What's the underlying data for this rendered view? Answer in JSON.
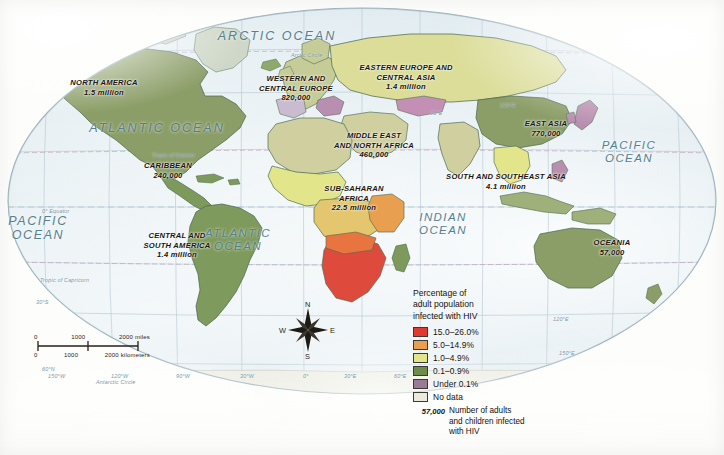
{
  "map": {
    "title": "World HIV prevalence map",
    "projection_shape": "oval",
    "ocean_labels": [
      {
        "name": "arctic-ocean",
        "text": "ARCTIC OCEAN",
        "x": 277,
        "y": 36,
        "size": 12.5,
        "spacing": 2.0
      },
      {
        "name": "atlantic-ocean-north",
        "text": "ATLANTIC OCEAN",
        "x": 157,
        "y": 128,
        "size": 12.5,
        "spacing": 2.0
      },
      {
        "name": "pacific-ocean-west",
        "text": "PACIFIC\nOCEAN",
        "x": 38,
        "y": 228,
        "size": 12.5,
        "spacing": 1.6
      },
      {
        "name": "atlantic-ocean-south",
        "text": "ATLANTIC\nOCEAN",
        "x": 238,
        "y": 240,
        "size": 11.5,
        "spacing": 1.4
      },
      {
        "name": "indian-ocean",
        "text": "INDIAN\nOCEAN",
        "x": 443,
        "y": 224,
        "size": 11.5,
        "spacing": 1.4
      },
      {
        "name": "pacific-ocean-east",
        "text": "PACIFIC\nOCEAN",
        "x": 629,
        "y": 152,
        "size": 11.5,
        "spacing": 1.4
      }
    ],
    "region_labels": [
      {
        "name": "north-america",
        "title": "NORTH AMERICA",
        "value": "1.5 million",
        "x": 104,
        "y": 88
      },
      {
        "name": "caribbean",
        "title": "CARIBBEAN",
        "value": "240,000",
        "x": 168,
        "y": 171
      },
      {
        "name": "central-south-america",
        "title": "CENTRAL AND\nSOUTH AMERICA",
        "value": "1.4 million",
        "x": 177,
        "y": 246
      },
      {
        "name": "western-central-europe",
        "title": "WESTERN AND\nCENTRAL EUROPE",
        "value": "820,000",
        "x": 296,
        "y": 89
      },
      {
        "name": "eastern-europe-central-asia",
        "title": "EASTERN EUROPE AND\nCENTRAL ASIA",
        "value": "1.4 million",
        "x": 406,
        "y": 78
      },
      {
        "name": "middle-east-north-africa",
        "title": "MIDDLE EAST\nAND NORTH AFRICA",
        "value": "460,000",
        "x": 374,
        "y": 146
      },
      {
        "name": "sub-saharan-africa",
        "title": "SUB-SAHARAN\nAFRICA",
        "value": "22.5 million",
        "x": 354,
        "y": 199
      },
      {
        "name": "east-asia",
        "title": "EAST ASIA",
        "value": "770,000",
        "x": 546,
        "y": 129
      },
      {
        "name": "south-southeast-asia",
        "title": "SOUTH AND SOUTHEAST ASIA",
        "value": "4.1 million",
        "x": 506,
        "y": 182
      },
      {
        "name": "oceania",
        "title": "OCEANIA",
        "value": "57,000",
        "x": 612,
        "y": 248
      }
    ],
    "graticule_labels": [
      {
        "name": "arctic-circle-top",
        "text": "Arctic Circle",
        "x": 291,
        "y": 52
      },
      {
        "name": "tropic-of-cancer",
        "text": "Tropic of Cancer",
        "x": 152,
        "y": 152
      },
      {
        "name": "equator-west",
        "text": "0°    Equator",
        "x": 42,
        "y": 208
      },
      {
        "name": "tropic-of-capricorn",
        "text": "Tropic of Capricorn",
        "x": 40,
        "y": 277
      },
      {
        "name": "lat-30s",
        "text": "30°S",
        "x": 36,
        "y": 299
      },
      {
        "name": "lat-60n",
        "text": "60°N",
        "x": 42,
        "y": 366
      },
      {
        "name": "antarctic-circle",
        "text": "Antarctic Circle",
        "x": 96,
        "y": 379
      },
      {
        "name": "lon-150w",
        "text": "150°W",
        "x": 48,
        "y": 373
      },
      {
        "name": "lon-120w",
        "text": "120°W",
        "x": 111,
        "y": 373
      },
      {
        "name": "lon-90w",
        "text": "90°W",
        "x": 176,
        "y": 373
      },
      {
        "name": "lon-30w",
        "text": "30°W",
        "x": 240,
        "y": 373
      },
      {
        "name": "lon-0",
        "text": "0°",
        "x": 303,
        "y": 373
      },
      {
        "name": "lon-30e",
        "text": "30°E",
        "x": 344,
        "y": 373
      },
      {
        "name": "lon-60e",
        "text": "60°E",
        "x": 394,
        "y": 373
      },
      {
        "name": "lon-120e",
        "text": "120°E",
        "x": 553,
        "y": 316
      },
      {
        "name": "lon-150e",
        "text": "150°E",
        "x": 559,
        "y": 350
      },
      {
        "name": "lon-90e-top",
        "text": "90°E",
        "x": 430,
        "y": 110
      },
      {
        "name": "lon-120e-top",
        "text": "120°E",
        "x": 500,
        "y": 102
      }
    ]
  },
  "legend": {
    "title": "Percentage of\nadult population\ninfected with HIV",
    "classes": [
      {
        "name": "class-15-26",
        "label": "15.0–26.0%",
        "color": "#e0392f"
      },
      {
        "name": "class-5-14",
        "label": "5.0–14.9%",
        "color": "#e8a050"
      },
      {
        "name": "class-1-4",
        "label": "1.0–4.9%",
        "color": "#e3e58a"
      },
      {
        "name": "class-0.1-0.9",
        "label": "0.1–0.9%",
        "color": "#6d8c4a"
      },
      {
        "name": "class-under-0.1",
        "label": "Under 0.1%",
        "color": "#9a7b96"
      },
      {
        "name": "class-no-data",
        "label": "No data",
        "color": "#eceade"
      }
    ],
    "note": {
      "key": "57,000",
      "text": "Number of adults\nand children infected\nwith HIV"
    }
  },
  "scale": {
    "miles": {
      "ticks": [
        "0",
        "1000",
        "2000 miles"
      ]
    },
    "kilometers": {
      "ticks": [
        "0",
        "1000",
        "2000 kilometers"
      ]
    }
  },
  "compass": {
    "north": "N",
    "east": "E",
    "south": "S",
    "west": "W"
  },
  "colors": {
    "ocean": "#dfeaef",
    "graticule": "#a9c0cb",
    "land_default": "#7d9a5c",
    "coastline": "#4d6b53",
    "text_dark": "#19140e",
    "text_ocean": "#55808f"
  }
}
